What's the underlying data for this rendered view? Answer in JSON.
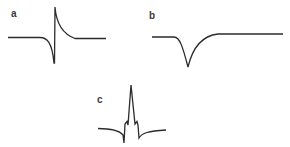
{
  "panels": [
    {
      "id": "a",
      "label": "a",
      "description": "biphasic waveform: gradual negative deflection, sharp vertical transition, exponential positive decay back to baseline"
    },
    {
      "id": "b",
      "label": "b",
      "description": "monophasic negative waveform: single downward V-shaped dip returning to baseline"
    },
    {
      "id": "c",
      "label": "c",
      "description": "complex waveform: negative deflections flanking a tall sharp positive spike with small notches"
    }
  ],
  "colors": {
    "stroke": "#2b2b2b",
    "label": "#3a3a3a",
    "background": "#ffffff"
  }
}
